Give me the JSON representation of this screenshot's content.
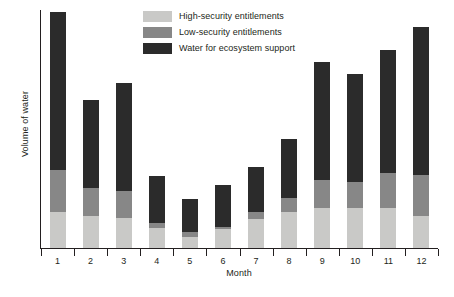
{
  "chart_data": {
    "type": "bar",
    "subtype": "stacked-bar",
    "title": "",
    "xlabel": "Month",
    "ylabel": "Volume of water",
    "grid": false,
    "legend_position": "top-left-inside",
    "y_axis_ticks_shown": false,
    "ylim": [
      0,
      238
    ],
    "categories": [
      "1",
      "2",
      "3",
      "4",
      "5",
      "6",
      "7",
      "8",
      "9",
      "10",
      "11",
      "12"
    ],
    "series": [
      {
        "name": "High-security entitlements",
        "color": "#c9c9c7",
        "values": [
          36,
          32,
          30,
          20,
          11,
          19,
          29,
          36,
          40,
          40,
          40,
          32
        ]
      },
      {
        "name": "Low-security entitlements",
        "color": "#878787",
        "values": [
          42,
          28,
          27,
          5,
          5,
          2,
          7,
          14,
          28,
          26,
          35,
          41
        ]
      },
      {
        "name": "Water for ecosystem support",
        "color": "#2b2b2b",
        "values": [
          158,
          88,
          108,
          47,
          33,
          42,
          45,
          59,
          118,
          108,
          123,
          148
        ]
      }
    ],
    "totals": [
      236,
      148,
      165,
      72,
      49,
      63,
      81,
      109,
      186,
      174,
      198,
      221
    ]
  },
  "legend": {
    "items": [
      {
        "label": "High-security entitlements",
        "color": "#c9c9c7"
      },
      {
        "label": "Low-security entitlements",
        "color": "#878787"
      },
      {
        "label": "Water for ecosystem support",
        "color": "#2b2b2b"
      }
    ]
  },
  "axes": {
    "x_title": "Month",
    "y_title": "Volume of water"
  },
  "colors": {
    "axis": "#231f20",
    "background": "#ffffff",
    "high_security": "#c9c9c7",
    "low_security": "#878787",
    "ecosystem": "#2b2b2b"
  }
}
